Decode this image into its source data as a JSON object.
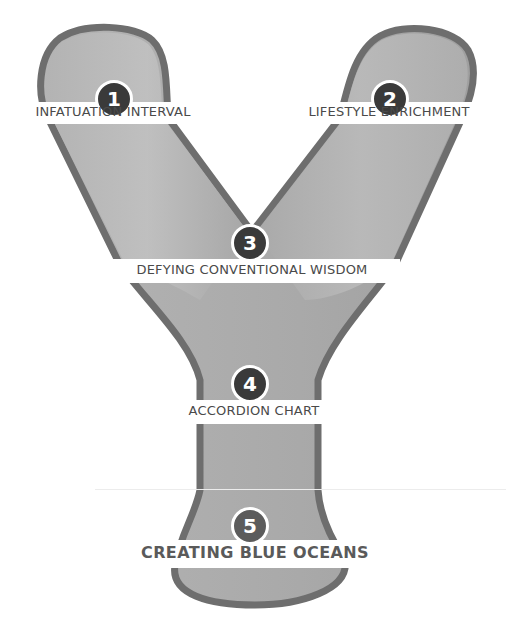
{
  "diagram": {
    "title_letter": "Y",
    "colors": {
      "outline": "#6e6e6e",
      "fill_light": "#bdbdbd",
      "fill_mid": "#a8a8a8",
      "badge": "#3a3a3a",
      "badge_last": "#5c5c5c",
      "label_text": "#4a4a4a",
      "background": "#ffffff"
    },
    "stages": [
      {
        "number": "1",
        "label": "INFATUATION INTERVAL"
      },
      {
        "number": "2",
        "label": "LIFESTYLE ENRICHMENT"
      },
      {
        "number": "3",
        "label": "DEFYING CONVENTIONAL WISDOM"
      },
      {
        "number": "4",
        "label": "ACCORDION CHART"
      },
      {
        "number": "5",
        "label": "CREATING BLUE OCEANS"
      }
    ]
  }
}
